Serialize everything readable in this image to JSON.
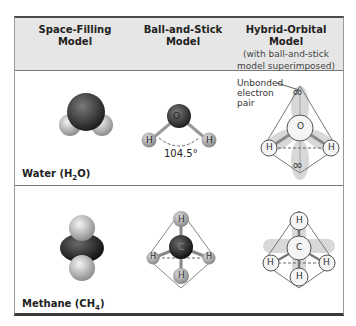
{
  "header": {
    "col1": {
      "line1": "Space-Filling",
      "line2": "Model"
    },
    "col2": {
      "line1": "Ball-and-Stick",
      "line2": "Model"
    },
    "col3": {
      "line1": "Hybrid-Orbital Model",
      "sub1": "(with ball-and-stick",
      "sub2": "model superimposed)"
    }
  },
  "rows": [
    {
      "label": "Water (H",
      "label_sub": "2",
      "label_end": "O)",
      "ball_stick": {
        "center_atom": "O",
        "outer_atoms": [
          "H",
          "H"
        ],
        "angle": "104.5°"
      },
      "hybrid": {
        "center_atom": "O",
        "outer_atoms": [
          "H",
          "H"
        ],
        "lone_pair_symbol": "oo"
      },
      "annotation": {
        "line1": "Unbonded",
        "line2": "electron",
        "line3": "pair"
      }
    },
    {
      "label": "Methane (CH",
      "label_sub": "4",
      "label_end": ")",
      "ball_stick": {
        "center_atom": "C",
        "outer_atoms": [
          "H",
          "H",
          "H",
          "H"
        ]
      },
      "hybrid": {
        "center_atom": "C",
        "outer_atoms": [
          "H",
          "H",
          "H",
          "H"
        ]
      }
    }
  ],
  "colors": {
    "header_bg": "#e6e6e6",
    "oxygen": "#8a8a8a",
    "carbon": "#3a3a3a",
    "hydrogen": "#bcbcbc",
    "orbital": "#d8d8d8"
  }
}
